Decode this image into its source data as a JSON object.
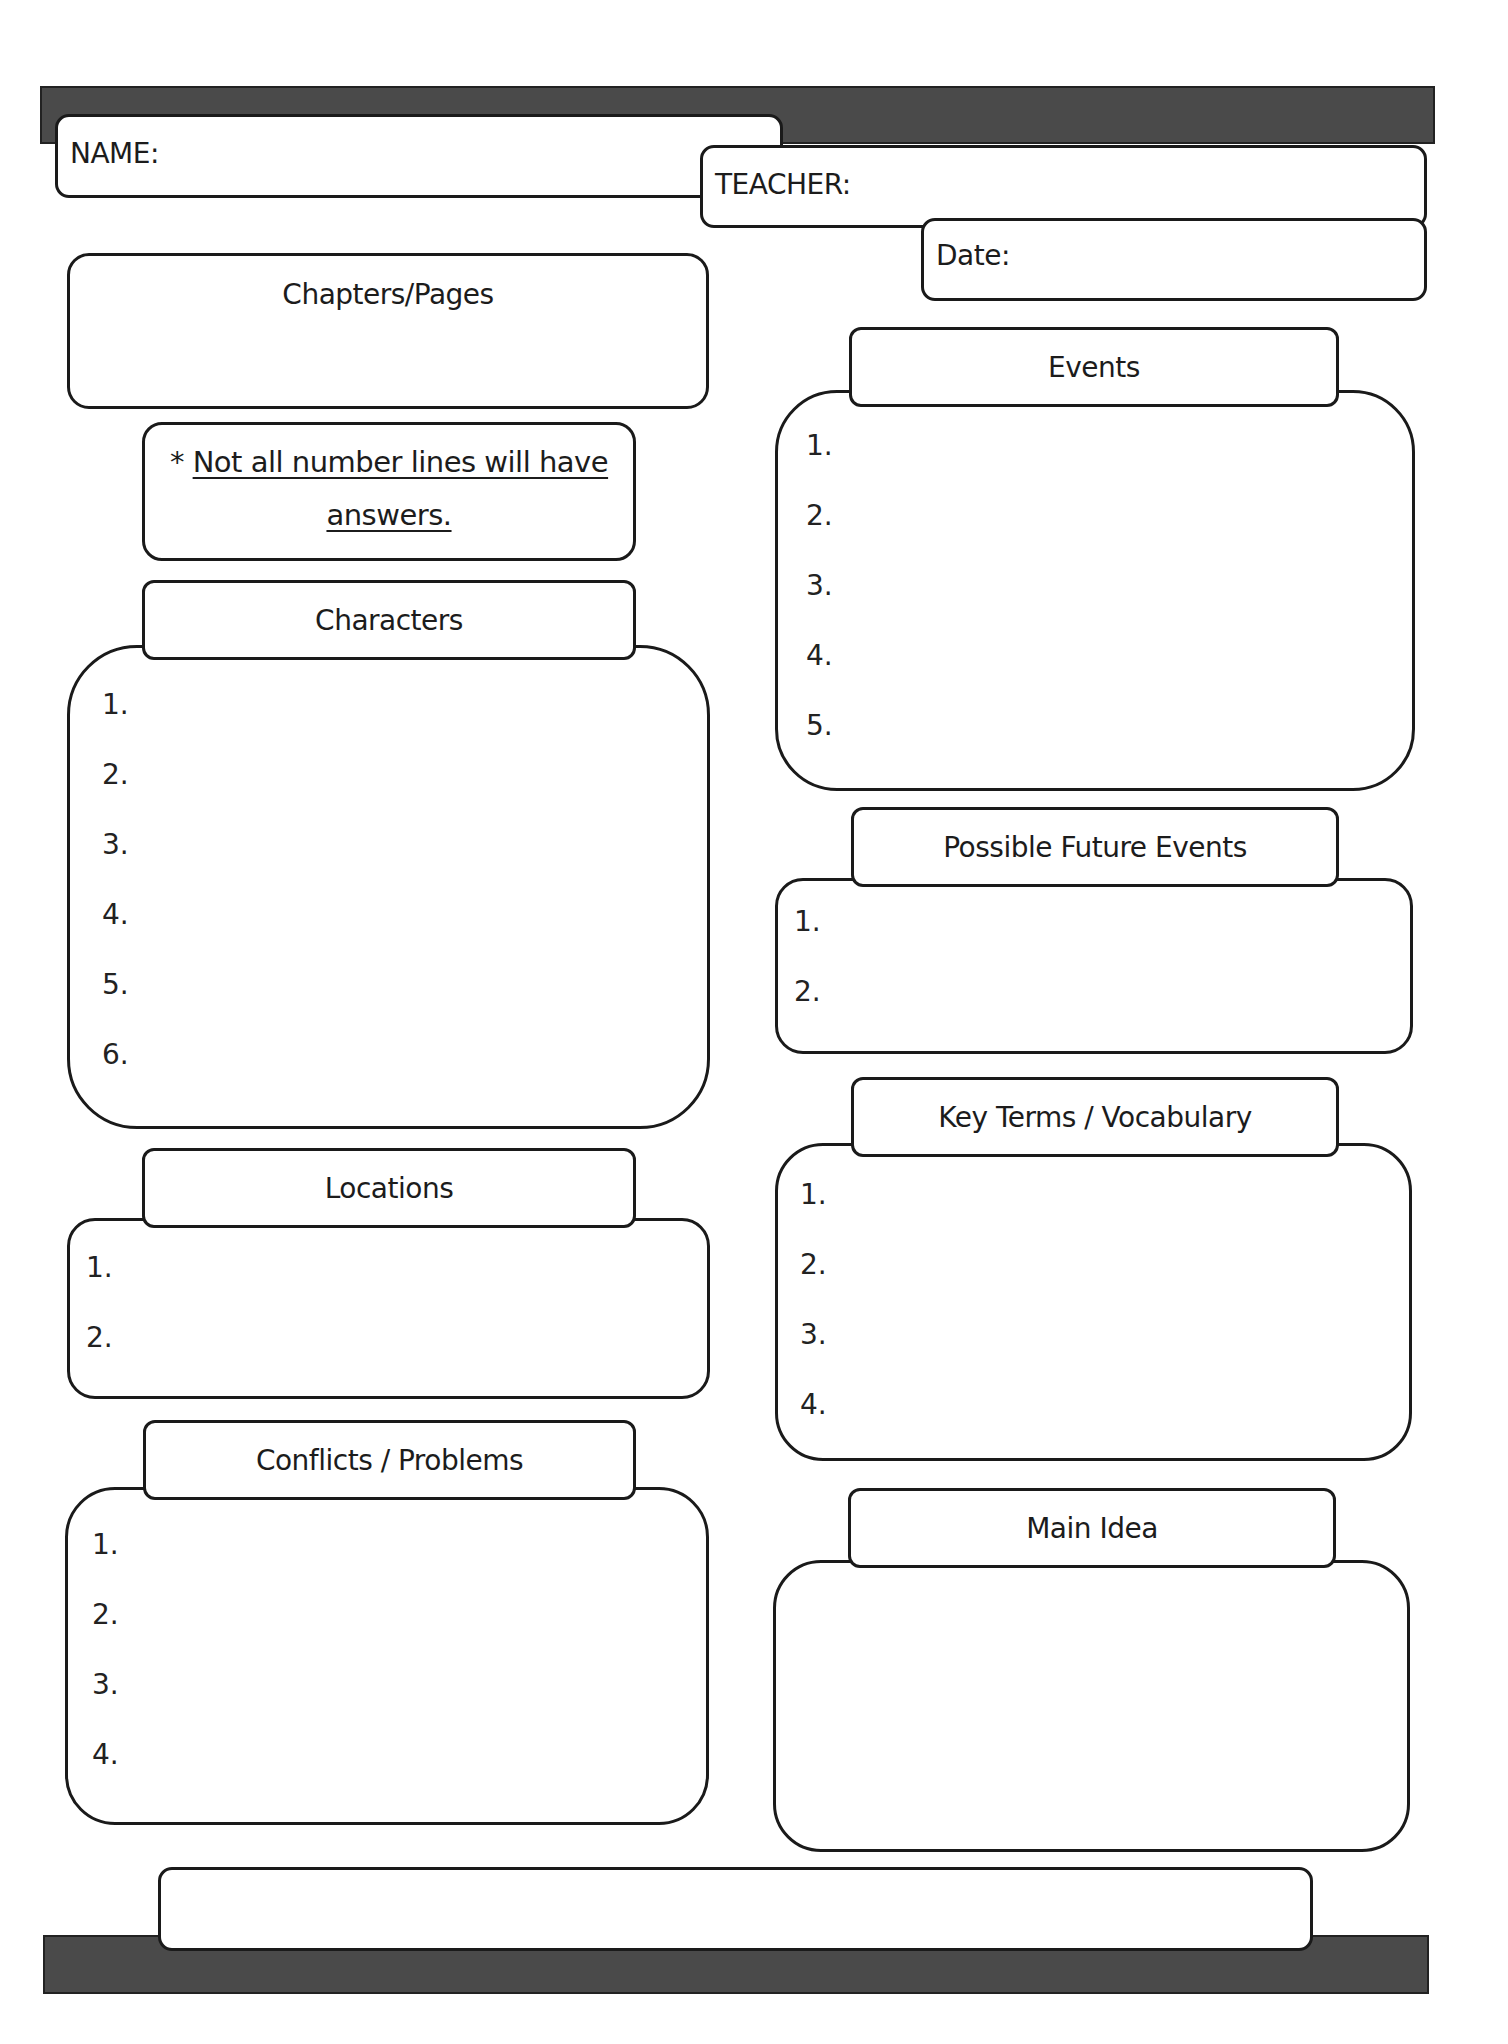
{
  "header": {
    "name_label": "NAME:",
    "teacher_label": "TEACHER:",
    "date_label": "Date:"
  },
  "chapters": {
    "label": "Chapters/Pages"
  },
  "note": {
    "asterisk": "*",
    "line1": "Not all number lines will have",
    "line2": "answers."
  },
  "sections": {
    "characters": {
      "title": "Characters",
      "items": [
        "1.",
        "2.",
        "3.",
        "4.",
        "5.",
        "6."
      ]
    },
    "locations": {
      "title": "Locations",
      "items": [
        "1.",
        "2."
      ]
    },
    "conflicts": {
      "title": "Conflicts / Problems",
      "items": [
        "1.",
        "2.",
        "3.",
        "4."
      ]
    },
    "events": {
      "title": "Events",
      "items": [
        "1.",
        "2.",
        "3.",
        "4.",
        "5."
      ]
    },
    "future_events": {
      "title": "Possible Future Events",
      "items": [
        "1.",
        "2."
      ]
    },
    "key_terms": {
      "title": "Key Terms / Vocabulary",
      "items": [
        "1.",
        "2.",
        "3.",
        "4."
      ]
    },
    "main_idea": {
      "title": "Main Idea"
    }
  },
  "colors": {
    "bar": "#4a4a4a",
    "border": "#1a1a1a",
    "background": "#ffffff"
  }
}
